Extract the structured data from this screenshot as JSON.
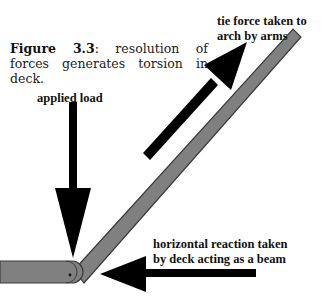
{
  "figure": {
    "number_label": "Figure 3.3",
    "caption_text": ": resolution of forces generates torsion in deck."
  },
  "labels": {
    "tie_force_line1": "tie force taken to",
    "tie_force_line2": "arch by arms",
    "applied_load": "applied load",
    "horizontal_line1": "horizontal reaction taken",
    "horizontal_line2": "by deck acting as a beam"
  },
  "colors": {
    "member_fill": "#808080",
    "member_edge": "#3a3a3a",
    "arrow": "#000000",
    "background": "#ffffff"
  }
}
